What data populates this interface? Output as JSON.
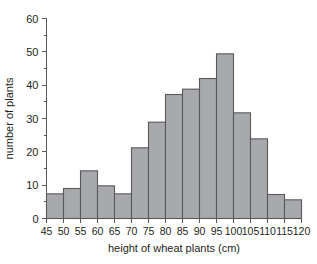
{
  "chart_data": {
    "type": "bar",
    "title": "",
    "xlabel": "height of wheat plants (cm)",
    "ylabel": "number of plants",
    "bin_edges": [
      45,
      50,
      55,
      60,
      65,
      70,
      75,
      80,
      85,
      90,
      95,
      100,
      105,
      110,
      115,
      120
    ],
    "categories": [
      "45-50",
      "50-55",
      "55-60",
      "60-65",
      "65-70",
      "70-75",
      "75-80",
      "80-85",
      "85-90",
      "90-95",
      "95-100",
      "100-105",
      "105-110",
      "110-115",
      "115-120"
    ],
    "values": [
      7.4,
      9,
      14.3,
      9.8,
      7.4,
      21.2,
      28.9,
      37.2,
      38.8,
      42,
      49.4,
      31.7,
      23.9,
      7.2,
      5.6
    ],
    "xlim": [
      45,
      120
    ],
    "ylim": [
      0,
      60
    ],
    "xticks": [
      "45",
      "50",
      "55",
      "60",
      "65",
      "70",
      "75",
      "80",
      "85",
      "90",
      "95",
      "100",
      "105",
      "110",
      "115",
      "120"
    ],
    "yticks": [
      "0",
      "10",
      "20",
      "30",
      "40",
      "50",
      "60"
    ],
    "y_minor_step": 5,
    "grid": false,
    "legend": false,
    "bar_fill_color": "#a7a9ac",
    "bar_edge_color": "#58595b",
    "axis_color": "#58595b",
    "text_color": "#231f20",
    "background_color": "#ffffff"
  }
}
